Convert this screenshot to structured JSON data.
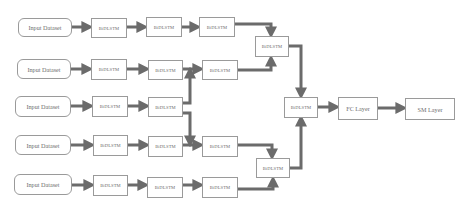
{
  "diagram": {
    "colors": {
      "arrow": "#6b6b6b",
      "box_border": "#9a9a9a",
      "text": "#6e6e6e",
      "background": "#ffffff"
    },
    "rows": [
      {
        "input": "Input Dataset",
        "lstm": [
          "BiDLSTM",
          "BiDLSTM",
          "BiDLSTM"
        ]
      },
      {
        "input": "Input Dataset",
        "lstm": [
          "BiDLSTM",
          "BiDLSTM",
          "BiDLSTM"
        ]
      },
      {
        "input": "Input Dataset",
        "lstm": [
          "BiDLSTM",
          "BiDLSTM"
        ]
      },
      {
        "input": "Input Dataset",
        "lstm": [
          "BiDLSTM",
          "BiDLSTM",
          "BiDLSTM"
        ]
      },
      {
        "input": "Input Dataset",
        "lstm": [
          "BiDLSTM",
          "BiDLSTM",
          "BiDLSTM"
        ]
      }
    ],
    "merge_top": "BiDLSTM",
    "merge_bottom": "BiDLSTM",
    "merge_center": "BiDLSTM",
    "fc_layer": "FC Layer",
    "sm_layer": "SM Layer"
  }
}
